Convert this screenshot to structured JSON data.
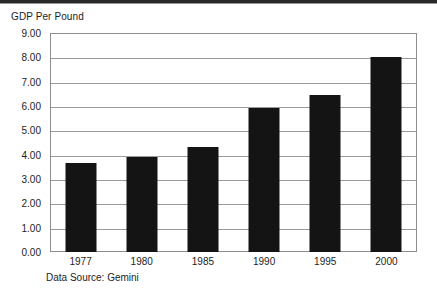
{
  "page": {
    "top_rule_color": "#2a2a2a",
    "background": "#ffffff"
  },
  "chart_data": {
    "type": "bar",
    "title": "GDP Per Pound",
    "subtitle": "",
    "xlabel": "",
    "ylabel": "GDP Per Pound",
    "categories": [
      "1977",
      "1980",
      "1985",
      "1990",
      "1995",
      "2000"
    ],
    "values": [
      3.65,
      3.9,
      4.3,
      5.9,
      6.45,
      8.0
    ],
    "series": [
      {
        "name": "GDP Per Pound",
        "values": [
          3.65,
          3.9,
          4.3,
          5.9,
          6.45,
          8.0
        ]
      }
    ],
    "ylim": [
      0.0,
      9.0
    ],
    "ytick_step": 1.0,
    "ytick_labels": [
      "9.00",
      "8.00",
      "7.00",
      "6.00",
      "5.00",
      "4.00",
      "3.00",
      "2.00",
      "1.00",
      "0.00"
    ],
    "ytick_values": [
      9.0,
      8.0,
      7.0,
      6.0,
      5.0,
      4.0,
      3.0,
      2.0,
      1.0,
      0.0
    ],
    "grid": true,
    "grid_axis": "y",
    "legend": false,
    "legend_position": "none",
    "bar_color": "#141414",
    "grid_color": "#9a9a9a",
    "frame_color": "#8d8d8d",
    "annotations": []
  },
  "footer": {
    "source_note": "Data Source: Gemini"
  }
}
